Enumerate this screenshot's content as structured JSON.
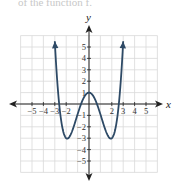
{
  "header": {
    "text": "of the function f."
  },
  "chart_data": {
    "type": "line",
    "title": "",
    "xlabel": "x",
    "ylabel": "y",
    "xlim": [
      -6,
      6
    ],
    "ylim": [
      -6,
      6
    ],
    "grid": true,
    "x_ticks": [
      -5,
      -4,
      -3,
      -2,
      2,
      3,
      4,
      5
    ],
    "y_ticks": [
      5,
      4,
      3,
      2,
      1,
      -1,
      -2,
      -3,
      -4,
      -5
    ],
    "x_tick_labels": [
      "−5",
      "−4",
      "−3",
      "−2",
      "2",
      "3",
      "4",
      "5"
    ],
    "y_tick_labels": [
      "5",
      "4",
      "3",
      "2",
      "1",
      "−1",
      "−2",
      "−3",
      "−4",
      "−5"
    ],
    "series": [
      {
        "name": "f(x)",
        "color": "#2e4a66",
        "description": "Even quartic (W-shape): local max (0,1), minima near (-2,-3) and (2,-3), arrows toward (-3,4) and (3,4)",
        "x": [
          -3,
          -2.5,
          -2,
          -1.5,
          -1,
          -0.5,
          0,
          0.5,
          1,
          1.5,
          2,
          2.5,
          3
        ],
        "y": [
          4,
          -1.2,
          -3,
          -2.2,
          -0.75,
          0.5,
          1,
          0.5,
          -0.75,
          -2.2,
          -3,
          -1.2,
          4
        ]
      }
    ]
  },
  "colors": {
    "grid": "#d9d9d9",
    "axis": "#222222",
    "curve": "#2e4a66"
  }
}
